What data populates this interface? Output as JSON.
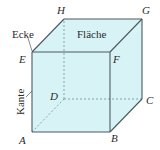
{
  "diagram": {
    "colors": {
      "face_fill": "#d8f3f6",
      "edge_stroke": "#4a5a60",
      "hidden_stroke": "#7a9aa2",
      "text": "#2b2b2b"
    },
    "vertices": {
      "A": {
        "label": "A",
        "x": 32,
        "y": 132
      },
      "B": {
        "label": "B",
        "x": 110,
        "y": 132
      },
      "C": {
        "label": "C",
        "x": 142,
        "y": 99
      },
      "D": {
        "label": "D",
        "x": 64,
        "y": 99
      },
      "E": {
        "label": "E",
        "x": 32,
        "y": 52
      },
      "F": {
        "label": "F",
        "x": 110,
        "y": 52
      },
      "G": {
        "label": "G",
        "x": 142,
        "y": 19
      },
      "H": {
        "label": "H",
        "x": 64,
        "y": 19
      }
    },
    "annotations": {
      "corner": "Ecke",
      "face": "Fläche",
      "edge": "Kante"
    },
    "hidden_edges": [
      "AD",
      "DC",
      "DH"
    ]
  }
}
